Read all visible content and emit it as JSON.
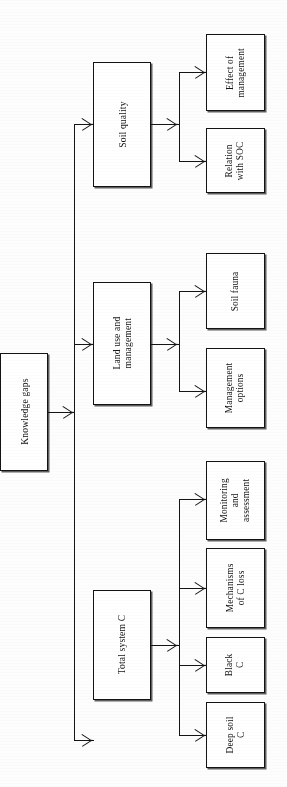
{
  "diagram": {
    "title": "Knowledge gaps",
    "orientation": "rotated-90-ccw",
    "type": "hierarchical-flowchart",
    "stroke_color": "#131313",
    "fill_color": "#ffffff",
    "background_color": "#fdfdfd",
    "root": {
      "label": "Knowledge gaps"
    },
    "branches": [
      {
        "label": "Soil quality",
        "children": [
          {
            "label": "Effect of\nmanagement",
            "line1": "Effect of",
            "line2": "management"
          },
          {
            "label": "Relation\nwith SOC",
            "line1": "Relation",
            "line2": "with SOC"
          }
        ]
      },
      {
        "label": "Land use and\nmanagement",
        "line1": "Land use and",
        "line2": "management",
        "children": [
          {
            "label": "Soil fauna",
            "line1": "Soil fauna",
            "line2": ""
          },
          {
            "label": "Management\noptions",
            "line1": "Management",
            "line2": "options"
          }
        ]
      },
      {
        "label": "Total system C",
        "children": [
          {
            "label": "Monitoring\nand\nassessment",
            "line1": "Monitoring",
            "line2": "and",
            "line3": "assessment"
          },
          {
            "label": "Mechanisms\nof C loss",
            "line1": "Mechanisms",
            "line2": "of C loss"
          },
          {
            "label": "Black\nC",
            "line1": "Black",
            "line2": "C"
          },
          {
            "label": "Deep soil\nC",
            "line1": "Deep soil",
            "line2": "C"
          }
        ]
      }
    ]
  }
}
